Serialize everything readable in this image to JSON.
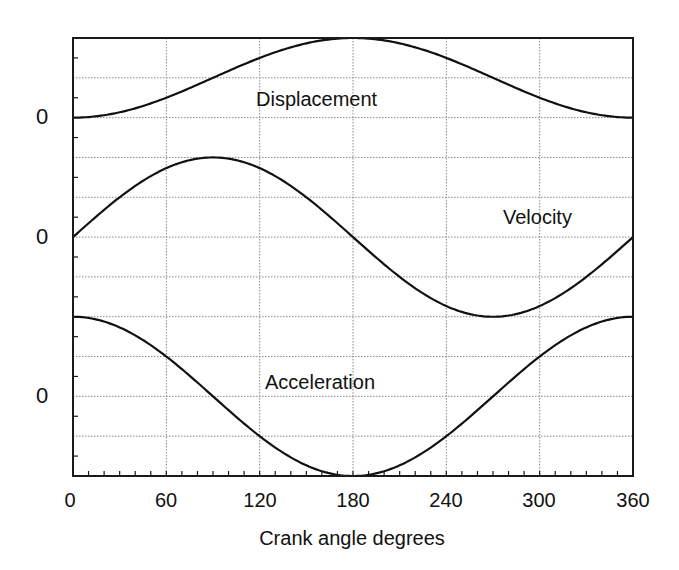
{
  "chart_data": {
    "type": "line",
    "title": "",
    "xlabel": "Crank angle degrees",
    "ylabel": "",
    "xlim": [
      0,
      360
    ],
    "x_ticks": [
      "0",
      "60",
      "120",
      "180",
      "240",
      "300",
      "360"
    ],
    "x_tick_values": [
      0,
      60,
      120,
      180,
      240,
      300,
      360
    ],
    "x_minor_tick_step": 10,
    "grid": true,
    "y_zero_labels": [
      "0",
      "0",
      "0"
    ],
    "series": [
      {
        "name": "Displacement",
        "label": "Displacement",
        "formula": "1 - cos(theta)",
        "x": [
          0,
          30,
          60,
          90,
          120,
          150,
          180,
          210,
          240,
          270,
          300,
          330,
          360
        ],
        "values": [
          0,
          0.134,
          0.5,
          1.0,
          1.5,
          1.866,
          2.0,
          1.866,
          1.5,
          1.0,
          0.5,
          0.134,
          0
        ],
        "zero_baseline_label": "0"
      },
      {
        "name": "Velocity",
        "label": "Velocity",
        "formula": "sin(theta)",
        "x": [
          0,
          30,
          60,
          90,
          120,
          150,
          180,
          210,
          240,
          270,
          300,
          330,
          360
        ],
        "values": [
          0,
          0.5,
          0.866,
          1.0,
          0.866,
          0.5,
          0,
          -0.5,
          -0.866,
          -1.0,
          -0.866,
          -0.5,
          0
        ],
        "zero_baseline_label": "0"
      },
      {
        "name": "Acceleration",
        "label": "Acceleration",
        "formula": "cos(theta)",
        "x": [
          0,
          30,
          60,
          90,
          120,
          150,
          180,
          210,
          240,
          270,
          300,
          330,
          360
        ],
        "values": [
          1.0,
          0.866,
          0.5,
          0,
          -0.5,
          -0.866,
          -1.0,
          -0.866,
          -0.5,
          0,
          0.5,
          0.866,
          1.0
        ],
        "zero_baseline_label": "0"
      }
    ],
    "annotations": [
      "Displacement",
      "Velocity",
      "Acceleration"
    ],
    "legend_position": "inline labels"
  },
  "layout": {
    "plot": {
      "left": 73,
      "right": 633,
      "top": 38,
      "bottom": 476
    },
    "h_grid_count": 11,
    "curve_color": "#111111",
    "grid_color": "#8a8a8a"
  }
}
